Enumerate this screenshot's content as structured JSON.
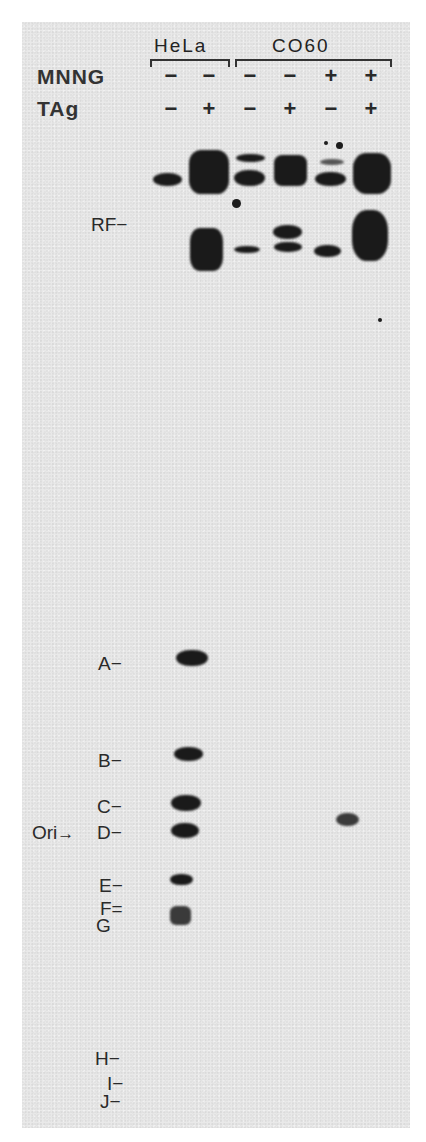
{
  "header": {
    "groups": [
      {
        "label": "HeLa",
        "lanes": [
          1,
          2
        ]
      },
      {
        "label": "CO60",
        "lanes": [
          3,
          4,
          5,
          6
        ]
      }
    ],
    "rows": [
      {
        "label": "MNNG",
        "values": [
          "−",
          "−",
          "−",
          "−",
          "+",
          "+"
        ]
      },
      {
        "label": "TAg",
        "values": [
          "−",
          "+",
          "−",
          "+",
          "−",
          "+"
        ]
      }
    ]
  },
  "labels": {
    "rf": "RF−",
    "ori_arrow": "Ori",
    "markers": [
      {
        "name": "A",
        "text": "A−"
      },
      {
        "name": "B",
        "text": "B−"
      },
      {
        "name": "C",
        "text": "C−"
      },
      {
        "name": "D",
        "text": "D−"
      },
      {
        "name": "E",
        "text": "E−"
      },
      {
        "name": "F",
        "text": "F="
      },
      {
        "name": "G",
        "text": "G"
      },
      {
        "name": "H",
        "text": "H−"
      },
      {
        "name": "I",
        "text": "I−"
      },
      {
        "name": "J",
        "text": "J−"
      }
    ],
    "arrow_icon": "→"
  },
  "gel": {
    "background": "#e9e9e9",
    "band_color": "#1a1a1a",
    "lane_count": 6
  }
}
